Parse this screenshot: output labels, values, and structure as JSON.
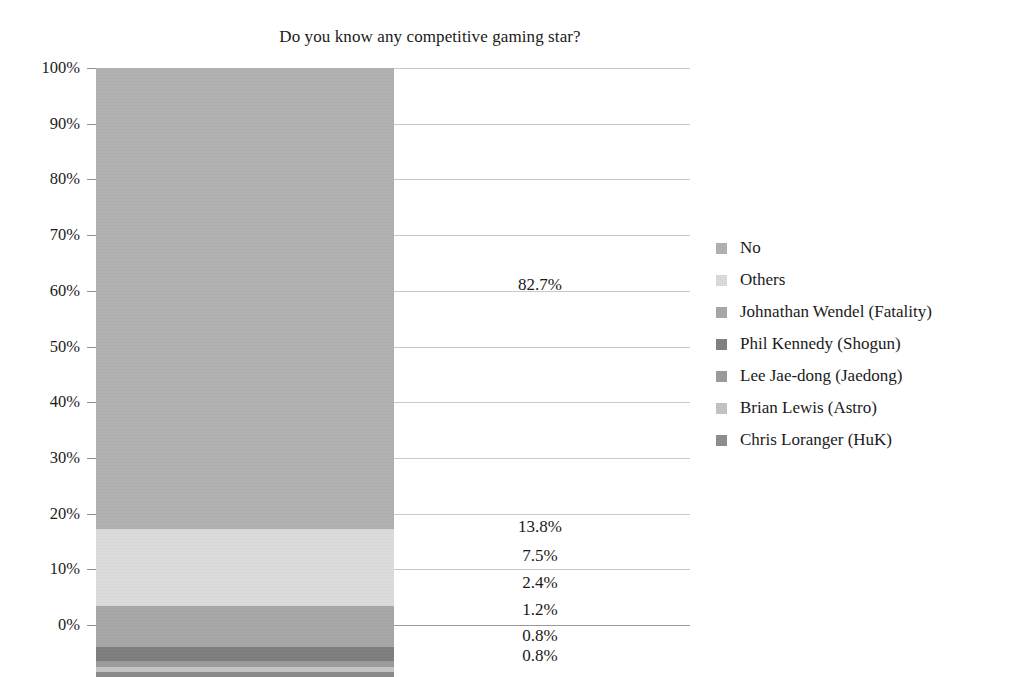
{
  "chart_data": {
    "type": "bar",
    "subtype": "stacked-percentage-single-column",
    "title": "Do you know any competitive gaming star?",
    "xlabel": "",
    "ylabel": "",
    "ylim": [
      0,
      100
    ],
    "grid": true,
    "legend_position": "right",
    "categories": [
      ""
    ],
    "y_ticks": [
      "0%",
      "10%",
      "20%",
      "30%",
      "40%",
      "50%",
      "60%",
      "70%",
      "80%",
      "90%",
      "100%"
    ],
    "y_tick_values": [
      0,
      10,
      20,
      30,
      40,
      50,
      60,
      70,
      80,
      90,
      100
    ],
    "series": [
      {
        "name": "No",
        "value": 82.7,
        "label": "82.7%",
        "color": "#b0b0b0"
      },
      {
        "name": "Others",
        "value": 13.8,
        "label": "13.8%",
        "color": "#dcdcdc"
      },
      {
        "name": "Johnathan Wendel (Fatality)",
        "value": 7.5,
        "label": "7.5%",
        "color": "#a6a6a6"
      },
      {
        "name": "Phil Kennedy (Shogun)",
        "value": 2.4,
        "label": "2.4%",
        "color": "#7d7d7d"
      },
      {
        "name": "Lee Jae-dong (Jaedong)",
        "value": 1.2,
        "label": "1.2%",
        "color": "#9a9a9a"
      },
      {
        "name": "Brian Lewis (Astro)",
        "value": 0.8,
        "label": "0.8%",
        "color": "#c4c4c4"
      },
      {
        "name": "Chris Loranger (HuK)",
        "value": 0.8,
        "label": "0.8%",
        "color": "#8a8a8a"
      }
    ],
    "data_labels": [
      "82.7%",
      "13.8%",
      "7.5%",
      "2.4%",
      "1.2%",
      "0.8%",
      "0.8%"
    ],
    "grid_color": "#c9c9c9",
    "axis_color": "#8f8f8f",
    "text_color": "#1a1a1a"
  },
  "legend": {
    "items": [
      {
        "label": "No",
        "color": "#b0b0b0"
      },
      {
        "label": "Others",
        "color": "#dcdcdc"
      },
      {
        "label": "Johnathan Wendel (Fatality)",
        "color": "#a6a6a6"
      },
      {
        "label": "Phil Kennedy (Shogun)",
        "color": "#7d7d7d"
      },
      {
        "label": "Lee Jae-dong (Jaedong)",
        "color": "#9a9a9a"
      },
      {
        "label": "Brian Lewis (Astro)",
        "color": "#c4c4c4"
      },
      {
        "label": "Chris Loranger (HuK)",
        "color": "#8a8a8a"
      }
    ]
  }
}
